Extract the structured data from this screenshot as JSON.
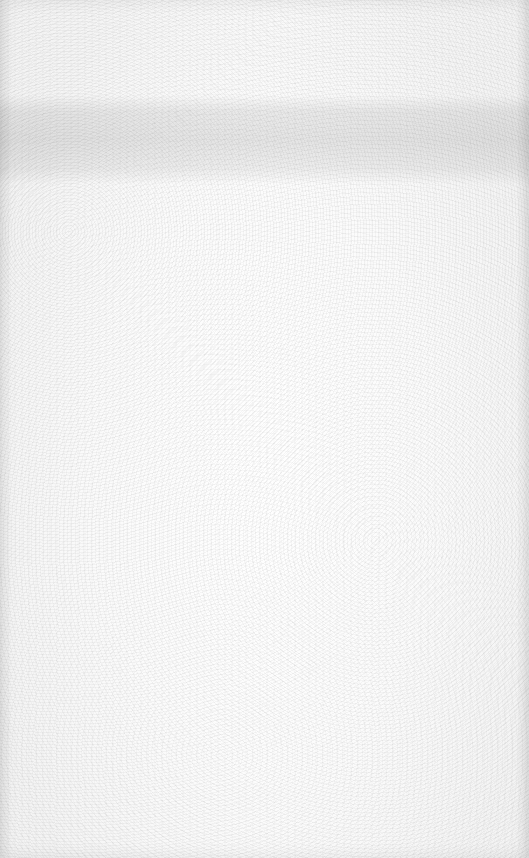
{
  "page": {
    "type": "blank-scanned-paper",
    "text_content": [],
    "colors": {
      "paper": "#f7f7f7",
      "band": "#d9d9d9",
      "edge": "#e4e4e4"
    }
  }
}
